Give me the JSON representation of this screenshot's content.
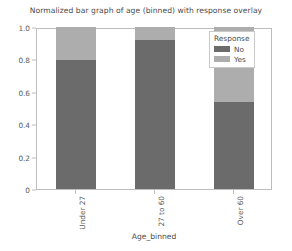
{
  "chart_data": {
    "type": "bar",
    "subtype": "stacked-100-percent",
    "title": "Normalized bar graph of age (binned) with response overlay",
    "xlabel": "Age_binned",
    "ylabel": "",
    "categories": [
      "Under 27",
      "27 to 60",
      "Over 60"
    ],
    "series": [
      {
        "name": "No",
        "values": [
          0.795,
          0.917,
          0.537
        ],
        "color": "#6b6b6b"
      },
      {
        "name": "Yes",
        "values": [
          0.205,
          0.083,
          0.463
        ],
        "color": "#adadad"
      }
    ],
    "ylim": [
      0,
      1.0
    ],
    "yticks": [
      0,
      0.2,
      0.4,
      0.6,
      0.8,
      1.0
    ],
    "ytick_labels": [
      "0",
      "0.2",
      "0.4",
      "0.6",
      "0.8",
      "1.0"
    ],
    "grid": false,
    "legend": {
      "title": "Response",
      "position": "upper right",
      "entries": [
        "No",
        "Yes"
      ]
    },
    "xtick_label_rotation": 90
  },
  "colors": {
    "no": "#6b6b6b",
    "yes": "#adadad",
    "axis": "#bdbdbd",
    "text": "#4a4a4a",
    "background": "#ffffff"
  }
}
